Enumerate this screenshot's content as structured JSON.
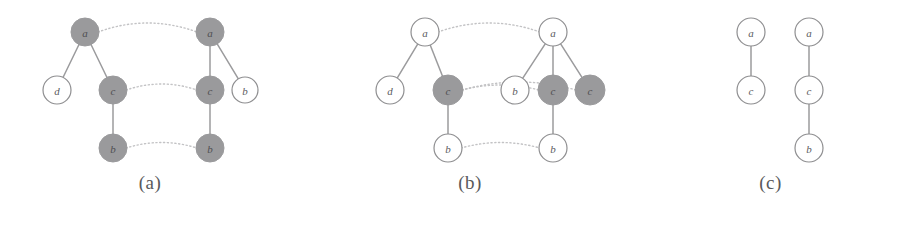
{
  "figure": {
    "background": "#ffffff",
    "node_fill_shaded": "#9a9a9c",
    "node_fill_open": "#ffffff",
    "node_stroke": "#8e8e90",
    "tree_edge_color": "#9b9b9d",
    "match_edge_color": "#c3c3c5",
    "caption_color": "#59595b"
  },
  "panels": [
    {
      "id": "a",
      "caption": "(a)",
      "nodes": [
        {
          "id": "a_l_a",
          "label": "a",
          "cx": 85,
          "cy": 32,
          "r": 14,
          "shaded": true
        },
        {
          "id": "a_l_d",
          "label": "d",
          "cx": 57,
          "cy": 90,
          "r": 14,
          "shaded": false
        },
        {
          "id": "a_l_c",
          "label": "c",
          "cx": 113,
          "cy": 90,
          "r": 14,
          "shaded": true
        },
        {
          "id": "a_l_b",
          "label": "b",
          "cx": 113,
          "cy": 148,
          "r": 14,
          "shaded": true
        },
        {
          "id": "a_r_a",
          "label": "a",
          "cx": 210,
          "cy": 32,
          "r": 14,
          "shaded": true
        },
        {
          "id": "a_r_c",
          "label": "c",
          "cx": 210,
          "cy": 90,
          "r": 14,
          "shaded": true
        },
        {
          "id": "a_r_b",
          "label": "b",
          "cx": 245,
          "cy": 90,
          "r": 13,
          "shaded": false
        },
        {
          "id": "a_r_b2",
          "label": "b",
          "cx": 210,
          "cy": 148,
          "r": 14,
          "shaded": true
        }
      ],
      "tree_edges": [
        {
          "from": "a_l_a",
          "to": "a_l_d"
        },
        {
          "from": "a_l_a",
          "to": "a_l_c"
        },
        {
          "from": "a_l_c",
          "to": "a_l_b"
        },
        {
          "from": "a_r_a",
          "to": "a_r_c"
        },
        {
          "from": "a_r_a",
          "to": "a_r_b"
        },
        {
          "from": "a_r_c",
          "to": "a_r_b2"
        }
      ],
      "match_edges": [
        {
          "from": "a_l_a",
          "to": "a_r_a",
          "bow": -18
        },
        {
          "from": "a_l_c",
          "to": "a_r_c",
          "bow": -12
        },
        {
          "from": "a_l_b",
          "to": "a_r_b2",
          "bow": -11
        }
      ]
    },
    {
      "id": "b",
      "caption": "(b)",
      "nodes": [
        {
          "id": "b_l_a",
          "label": "a",
          "cx": 125,
          "cy": 32,
          "r": 14,
          "shaded": false
        },
        {
          "id": "b_l_d",
          "label": "d",
          "cx": 90,
          "cy": 90,
          "r": 14,
          "shaded": false
        },
        {
          "id": "b_l_c",
          "label": "c",
          "cx": 148,
          "cy": 90,
          "r": 15,
          "shaded": true
        },
        {
          "id": "b_l_b",
          "label": "b",
          "cx": 148,
          "cy": 148,
          "r": 14,
          "shaded": false
        },
        {
          "id": "b_r_a",
          "label": "a",
          "cx": 253,
          "cy": 32,
          "r": 14,
          "shaded": false
        },
        {
          "id": "b_r_b",
          "label": "b",
          "cx": 215,
          "cy": 90,
          "r": 14,
          "shaded": false
        },
        {
          "id": "b_r_c1",
          "label": "c",
          "cx": 253,
          "cy": 90,
          "r": 15,
          "shaded": true
        },
        {
          "id": "b_r_c2",
          "label": "c",
          "cx": 290,
          "cy": 90,
          "r": 15,
          "shaded": true
        },
        {
          "id": "b_r_b2",
          "label": "b",
          "cx": 253,
          "cy": 148,
          "r": 14,
          "shaded": false
        }
      ],
      "tree_edges": [
        {
          "from": "b_l_a",
          "to": "b_l_d"
        },
        {
          "from": "b_l_a",
          "to": "b_l_c"
        },
        {
          "from": "b_l_c",
          "to": "b_l_b"
        },
        {
          "from": "b_r_a",
          "to": "b_r_b"
        },
        {
          "from": "b_r_a",
          "to": "b_r_c1"
        },
        {
          "from": "b_r_a",
          "to": "b_r_c2"
        },
        {
          "from": "b_r_c1",
          "to": "b_r_b2"
        }
      ],
      "match_edges": [
        {
          "from": "b_l_a",
          "to": "b_r_a",
          "bow": -18
        },
        {
          "from": "b_l_c",
          "to": "b_r_c1",
          "bow": -10
        },
        {
          "from": "b_l_c",
          "to": "b_r_c2",
          "bow": -16
        },
        {
          "from": "b_l_b",
          "to": "b_r_b2",
          "bow": -11
        }
      ]
    },
    {
      "id": "c",
      "caption": "(c)",
      "nodes": [
        {
          "id": "c_l_a",
          "label": "a",
          "cx": 111,
          "cy": 32,
          "r": 14,
          "shaded": false
        },
        {
          "id": "c_l_c",
          "label": "c",
          "cx": 111,
          "cy": 90,
          "r": 14,
          "shaded": false
        },
        {
          "id": "c_r_a",
          "label": "a",
          "cx": 169,
          "cy": 32,
          "r": 14,
          "shaded": false
        },
        {
          "id": "c_r_c",
          "label": "c",
          "cx": 169,
          "cy": 90,
          "r": 14,
          "shaded": false
        },
        {
          "id": "c_r_b",
          "label": "b",
          "cx": 169,
          "cy": 148,
          "r": 14,
          "shaded": false
        }
      ],
      "tree_edges": [
        {
          "from": "c_l_a",
          "to": "c_l_c"
        },
        {
          "from": "c_r_a",
          "to": "c_r_c"
        },
        {
          "from": "c_r_c",
          "to": "c_r_b"
        }
      ],
      "match_edges": []
    }
  ]
}
